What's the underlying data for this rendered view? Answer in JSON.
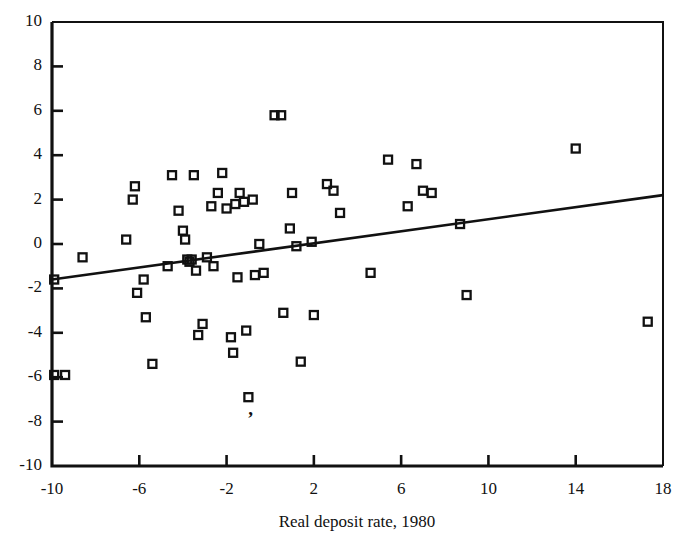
{
  "chart_data": {
    "type": "scatter",
    "title": "",
    "xlabel": "Real deposit rate, 1980",
    "ylabel": "",
    "xlim": [
      -10,
      18
    ],
    "ylim": [
      -10,
      10
    ],
    "xticks": [
      -10,
      -6,
      -2,
      2,
      6,
      10,
      14,
      18
    ],
    "xticklabels": [
      "-10",
      "-6",
      "-2",
      "2",
      "6",
      "10",
      "14",
      "18"
    ],
    "xminorticks": [
      -8,
      -4,
      0,
      4,
      8,
      12,
      16
    ],
    "yticks": [
      -10,
      -8,
      -6,
      -4,
      -2,
      0,
      2,
      4,
      6,
      8,
      10
    ],
    "yticklabels": [
      "-10",
      "-8",
      "-6",
      "-4",
      "-2",
      "0",
      "2",
      "4",
      "6",
      "8",
      "10"
    ],
    "grid": false,
    "legend": null,
    "marker": "open-square",
    "marker_color": "#111111",
    "line_color": "#111111",
    "series": [
      {
        "name": "observations",
        "points": [
          [
            -9.9,
            -1.6
          ],
          [
            -9.9,
            -5.9
          ],
          [
            -9.4,
            -5.9
          ],
          [
            -8.6,
            -0.6
          ],
          [
            -6.6,
            0.2
          ],
          [
            -6.3,
            2.0
          ],
          [
            -6.2,
            2.6
          ],
          [
            -6.1,
            -2.2
          ],
          [
            -5.8,
            -1.6
          ],
          [
            -5.7,
            -3.3
          ],
          [
            -5.4,
            -5.4
          ],
          [
            -4.7,
            -1.0
          ],
          [
            -4.5,
            3.1
          ],
          [
            -4.2,
            1.5
          ],
          [
            -4.0,
            0.6
          ],
          [
            -3.9,
            0.2
          ],
          [
            -3.8,
            -0.7
          ],
          [
            -3.7,
            -0.8
          ],
          [
            -3.6,
            -0.7
          ],
          [
            -3.5,
            3.1
          ],
          [
            -3.4,
            -1.2
          ],
          [
            -3.3,
            -4.1
          ],
          [
            -3.1,
            -3.6
          ],
          [
            -2.9,
            -0.6
          ],
          [
            -2.7,
            1.7
          ],
          [
            -2.6,
            -1.0
          ],
          [
            -2.4,
            2.3
          ],
          [
            -2.2,
            3.2
          ],
          [
            -2.0,
            1.6
          ],
          [
            -1.8,
            -4.2
          ],
          [
            -1.7,
            -4.9
          ],
          [
            -1.6,
            1.8
          ],
          [
            -1.5,
            -1.5
          ],
          [
            -1.4,
            2.3
          ],
          [
            -1.2,
            1.9
          ],
          [
            -1.1,
            -3.9
          ],
          [
            -1.0,
            -6.9
          ],
          [
            -0.8,
            2.0
          ],
          [
            -0.7,
            -1.4
          ],
          [
            -0.5,
            0.0
          ],
          [
            -0.3,
            -1.3
          ],
          [
            0.2,
            5.8
          ],
          [
            0.5,
            5.8
          ],
          [
            0.6,
            -3.1
          ],
          [
            0.9,
            0.7
          ],
          [
            1.0,
            2.3
          ],
          [
            1.2,
            -0.1
          ],
          [
            1.4,
            -5.3
          ],
          [
            1.9,
            0.1
          ],
          [
            2.0,
            -3.2
          ],
          [
            2.6,
            2.7
          ],
          [
            2.9,
            2.4
          ],
          [
            3.2,
            1.4
          ],
          [
            4.6,
            -1.3
          ],
          [
            5.4,
            3.8
          ],
          [
            6.3,
            1.7
          ],
          [
            6.7,
            3.6
          ],
          [
            7.0,
            2.4
          ],
          [
            7.4,
            2.3
          ],
          [
            8.7,
            0.9
          ],
          [
            9.0,
            -2.3
          ],
          [
            14.0,
            4.3
          ],
          [
            17.3,
            -3.5
          ]
        ]
      }
    ],
    "fit_line": {
      "name": "ordinary-least-squares-fit",
      "x0": -10,
      "y0": -1.6,
      "x1": 18,
      "y1": 2.2
    },
    "annotations": [
      {
        "text": ",",
        "x": -0.9,
        "y": -7.5,
        "name": "stray-comma-mark"
      }
    ]
  },
  "geometry": {
    "plot_left": 52,
    "plot_right": 663,
    "plot_top": 22,
    "plot_bottom": 466
  }
}
